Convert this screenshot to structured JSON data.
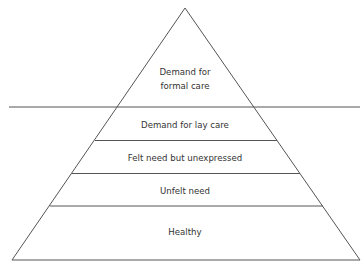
{
  "diagram": {
    "type": "pyramid",
    "threshold_line": "horizontal line separating formal care from lower levels",
    "levels": [
      {
        "label_lines": [
          "Demand for",
          "formal care"
        ]
      },
      {
        "label_lines": [
          "Demand for lay care"
        ]
      },
      {
        "label_lines": [
          "Felt need but unexpressed"
        ]
      },
      {
        "label_lines": [
          "Unfelt need"
        ]
      },
      {
        "label_lines": [
          "Healthy"
        ]
      }
    ]
  },
  "colors": {
    "line": "#555555",
    "text": "#333333",
    "background": "#ffffff"
  }
}
